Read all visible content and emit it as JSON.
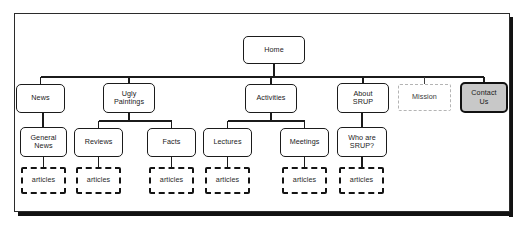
{
  "diagram": {
    "type": "tree",
    "frame": {
      "style": "solid-border-with-drop-shadow",
      "border_color": "#2b2b2b",
      "shadow_color": "#121212"
    },
    "legend_styles": {
      "solid": "standard page - solid rounded black border, white fill",
      "filled": "highlighted page - gray fill, thick rounded black border",
      "ghost": "proposed/optional page - light gray thin dashed border",
      "leaf": "content collection - thick black dashed border"
    },
    "levels": [
      {
        "level": 1,
        "nodes": [
          {
            "id": "home",
            "label": "Home",
            "style": "solid",
            "x": 243,
            "y": 36,
            "w": 62,
            "h": 28
          }
        ]
      },
      {
        "level": 2,
        "nodes": [
          {
            "id": "news",
            "label": "News",
            "style": "solid",
            "x": 16,
            "y": 84,
            "w": 49,
            "h": 29
          },
          {
            "id": "ugly-paintings",
            "label": "Ugly\nPaintings",
            "style": "solid",
            "x": 103,
            "y": 83,
            "w": 52,
            "h": 30
          },
          {
            "id": "activities",
            "label": "Activities",
            "style": "solid",
            "x": 245,
            "y": 84,
            "w": 52,
            "h": 29
          },
          {
            "id": "about-srup",
            "label": "About\nSRUP",
            "style": "solid",
            "x": 337,
            "y": 83,
            "w": 52,
            "h": 30
          },
          {
            "id": "mission",
            "label": "Mission",
            "style": "ghost",
            "x": 398,
            "y": 84,
            "w": 53,
            "h": 27
          },
          {
            "id": "contact-us",
            "label": "Contact\nUs",
            "style": "filled",
            "x": 460,
            "y": 82,
            "w": 48,
            "h": 31
          }
        ]
      },
      {
        "level": 3,
        "nodes": [
          {
            "id": "general-news",
            "label": "General\nNews",
            "style": "solid",
            "x": 20,
            "y": 127,
            "w": 47,
            "h": 30
          },
          {
            "id": "reviews",
            "label": "Reviews",
            "style": "solid",
            "x": 74,
            "y": 128,
            "w": 49,
            "h": 29
          },
          {
            "id": "facts",
            "label": "Facts",
            "style": "solid",
            "x": 147,
            "y": 128,
            "w": 49,
            "h": 29
          },
          {
            "id": "lectures",
            "label": "Lectures",
            "style": "solid",
            "x": 203,
            "y": 128,
            "w": 49,
            "h": 29
          },
          {
            "id": "meetings",
            "label": "Meetings",
            "style": "solid",
            "x": 280,
            "y": 128,
            "w": 49,
            "h": 29
          },
          {
            "id": "who-are-srup",
            "label": "Who are\nSRUP?",
            "style": "solid",
            "x": 337,
            "y": 127,
            "w": 50,
            "h": 30
          },
          {
            "id": "spacer-mission",
            "label": "",
            "style": "none",
            "x": 0,
            "y": 0,
            "w": 0,
            "h": 0
          }
        ]
      },
      {
        "level": 4,
        "nodes": [
          {
            "id": "articles-general-news",
            "label": "articles",
            "style": "leaf",
            "x": 21,
            "y": 167,
            "w": 45,
            "h": 27
          },
          {
            "id": "articles-reviews",
            "label": "articles",
            "style": "leaf",
            "x": 76,
            "y": 167,
            "w": 45,
            "h": 27
          },
          {
            "id": "articles-facts",
            "label": "articles",
            "style": "leaf",
            "x": 149,
            "y": 167,
            "w": 45,
            "h": 27
          },
          {
            "id": "articles-lectures",
            "label": "articles",
            "style": "leaf",
            "x": 205,
            "y": 167,
            "w": 45,
            "h": 27
          },
          {
            "id": "articles-meetings",
            "label": "articles",
            "style": "leaf",
            "x": 282,
            "y": 167,
            "w": 45,
            "h": 27
          },
          {
            "id": "articles-who-are-srup",
            "label": "articles",
            "style": "leaf",
            "x": 339,
            "y": 167,
            "w": 45,
            "h": 27
          }
        ]
      }
    ],
    "edges": [
      {
        "from": "home",
        "to": "news"
      },
      {
        "from": "home",
        "to": "ugly-paintings"
      },
      {
        "from": "home",
        "to": "activities"
      },
      {
        "from": "home",
        "to": "about-srup"
      },
      {
        "from": "home",
        "to": "mission"
      },
      {
        "from": "home",
        "to": "contact-us"
      },
      {
        "from": "news",
        "to": "general-news"
      },
      {
        "from": "ugly-paintings",
        "to": "reviews"
      },
      {
        "from": "ugly-paintings",
        "to": "facts"
      },
      {
        "from": "activities",
        "to": "lectures"
      },
      {
        "from": "activities",
        "to": "meetings"
      },
      {
        "from": "about-srup",
        "to": "who-are-srup"
      },
      {
        "from": "general-news",
        "to": "articles-general-news"
      },
      {
        "from": "reviews",
        "to": "articles-reviews"
      },
      {
        "from": "facts",
        "to": "articles-facts"
      },
      {
        "from": "lectures",
        "to": "articles-lectures"
      },
      {
        "from": "meetings",
        "to": "articles-meetings"
      },
      {
        "from": "who-are-srup",
        "to": "articles-who-are-srup"
      }
    ]
  }
}
